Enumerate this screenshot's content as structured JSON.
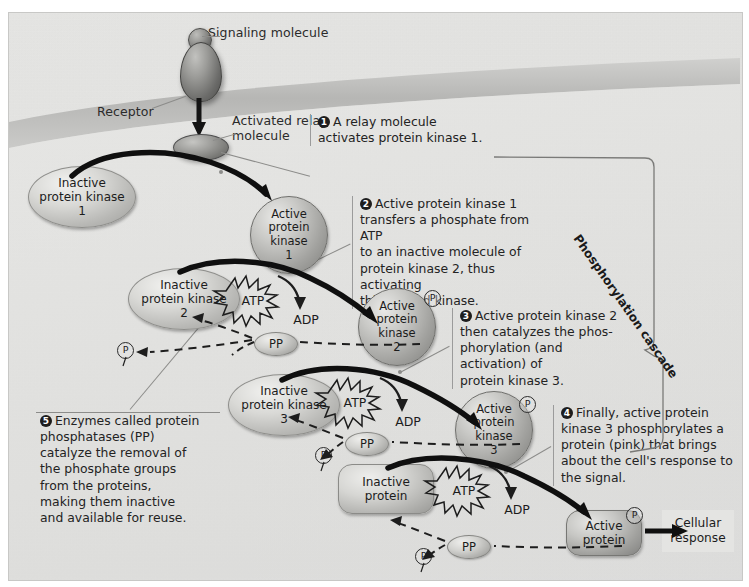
{
  "figure": {
    "cascade_label": "Phosphorylation cascade"
  },
  "labels": {
    "signaling_molecule": "Signaling molecule",
    "receptor": "Receptor",
    "activated_relay_line1": "Activated relay",
    "activated_relay_line2": "molecule",
    "cellular_response_line1": "Cellular",
    "cellular_response_line2": "response"
  },
  "molecules": {
    "inactive_kinase_1": "Inactive\nprotein kinase\n1",
    "active_kinase_1": "Active\nprotein\nkinase\n1",
    "inactive_kinase_2": "Inactive\nprotein kinase\n2",
    "active_kinase_2": "Active\nprotein\nkinase\n2",
    "inactive_kinase_3": "Inactive\nprotein kinase\n3",
    "active_kinase_3": "Active\nprotein\nkinase\n3",
    "inactive_protein": "Inactive\nprotein",
    "active_protein": "Active\nprotein"
  },
  "energy": {
    "atp": "ATP",
    "adp": "ADP",
    "phosphatase": "PP",
    "phosphate": "P"
  },
  "steps": [
    {
      "number": "1",
      "text": "A relay molecule\nactivates protein kinase 1."
    },
    {
      "number": "2",
      "text": "Active protein kinase 1\ntransfers a phosphate from ATP\nto an inactive molecule of\nprotein kinase 2, thus activating\nthis second kinase."
    },
    {
      "number": "3",
      "text": "Active protein kinase 2\nthen catalyzes the phos-\nphorylation (and activation) of\nprotein kinase 3."
    },
    {
      "number": "4",
      "text": "Finally, active protein\nkinase 3 phosphorylates a\nprotein (pink) that brings\nabout the cell's response to\nthe signal."
    },
    {
      "number": "5",
      "text": "Enzymes called protein\nphosphatases (PP)\ncatalyze the removal of\nthe phosphate groups\nfrom the proteins,\nmaking them inactive\nand available for reuse."
    }
  ],
  "colors": {
    "background": "#e4e4e2",
    "membrane": "#bfbfbd",
    "outline": "#1d1d1d",
    "text": "#232323"
  }
}
